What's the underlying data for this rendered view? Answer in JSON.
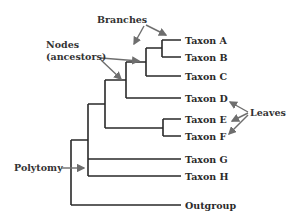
{
  "diagram": {
    "type": "phylogenetic-tree",
    "colors": {
      "line": "#2a2a2a",
      "arrow": "#6e6e6e",
      "text": "#2a2a2a"
    },
    "taxa": [
      {
        "label": "Taxon A"
      },
      {
        "label": "Taxon B"
      },
      {
        "label": "Taxon C"
      },
      {
        "label": "Taxon D"
      },
      {
        "label": "Taxon E"
      },
      {
        "label": "Taxon F"
      },
      {
        "label": "Taxon G"
      },
      {
        "label": "Taxon H"
      },
      {
        "label": "Outgroup"
      }
    ],
    "annotations": {
      "branches": "Branches",
      "nodes_line1": "Nodes",
      "nodes_line2": "(ancestors)",
      "leaves": "Leaves",
      "polytomy": "Polytomy"
    },
    "newick": "(((((A,B),C),D,(E,F)),G,H),Outgroup)"
  }
}
